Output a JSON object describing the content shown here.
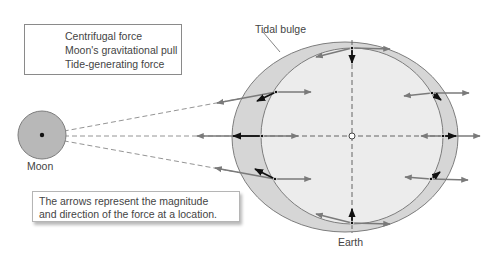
{
  "legend": {
    "items": [
      {
        "label": "Centrifugal force",
        "icon": "gray-right-arrow"
      },
      {
        "label": "Moon's gravitational pull",
        "icon": "gray-left-arrow"
      },
      {
        "label": "Tide-generating force",
        "icon": "black-diagonal-arrow"
      }
    ]
  },
  "labels": {
    "moon": "Moon",
    "earth": "Earth",
    "tidal_bulge": "Tidal bulge"
  },
  "note": {
    "line1": "The arrows represent the magnitude",
    "line2": "and direction of the force at a location."
  },
  "colors": {
    "centrifugal": "#7a7a7a",
    "moon_pull": "#7a7a7a",
    "tide_generating": "#111111",
    "bulge_fill": "#d6d6d6",
    "earth_fill": "#ececec",
    "moon_fill": "#b8b8b8",
    "outline": "#7d7d7d"
  },
  "force_points": [
    {
      "position": "top",
      "x": 352,
      "y": 48
    },
    {
      "position": "upper-left",
      "x": 276,
      "y": 92
    },
    {
      "position": "left",
      "x": 262,
      "y": 136
    },
    {
      "position": "lower-left",
      "x": 275,
      "y": 179
    },
    {
      "position": "bottom",
      "x": 352,
      "y": 223
    },
    {
      "position": "lower-right",
      "x": 431,
      "y": 179
    },
    {
      "position": "right",
      "x": 443,
      "y": 136
    },
    {
      "position": "upper-right",
      "x": 432,
      "y": 93
    }
  ]
}
